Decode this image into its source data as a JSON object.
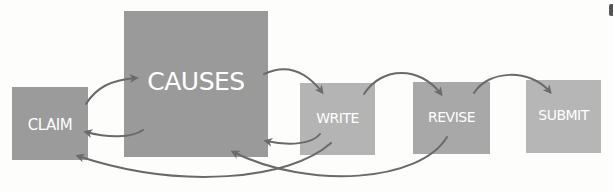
{
  "diagram": {
    "nodes": [
      {
        "id": "claim",
        "label": "CLAIM",
        "x": 12,
        "y": 87,
        "w": 76,
        "h": 73,
        "color": "#9b9b9b",
        "font_size": 15,
        "label_top": 31
      },
      {
        "id": "causes",
        "label": "CAUSES",
        "x": 124,
        "y": 11,
        "w": 144,
        "h": 146,
        "color": "#9a9a9a",
        "font_size": 25,
        "label_top": 60
      },
      {
        "id": "write",
        "label": "WRITE",
        "x": 300,
        "y": 83,
        "w": 75,
        "h": 72,
        "color": "#b4b4b4",
        "font_size": 14,
        "label_top": 27
      },
      {
        "id": "revise",
        "label": "REVISE",
        "x": 413,
        "y": 82,
        "w": 77,
        "h": 72,
        "color": "#a8a8a8",
        "font_size": 14,
        "label_top": 28
      },
      {
        "id": "submit",
        "label": "SUBMIT",
        "x": 526,
        "y": 80,
        "w": 75,
        "h": 73,
        "color": "#b6b6b6",
        "font_size": 14,
        "label_top": 27
      }
    ],
    "edges": [
      {
        "from": "claim",
        "to": "causes",
        "direction": "forward"
      },
      {
        "from": "causes",
        "to": "claim",
        "direction": "back"
      },
      {
        "from": "causes",
        "to": "write",
        "direction": "forward"
      },
      {
        "from": "write",
        "to": "causes",
        "direction": "back"
      },
      {
        "from": "write",
        "to": "claim",
        "direction": "back"
      },
      {
        "from": "write",
        "to": "revise",
        "direction": "forward"
      },
      {
        "from": "revise",
        "to": "causes",
        "direction": "back"
      },
      {
        "from": "revise",
        "to": "submit",
        "direction": "forward"
      }
    ],
    "arrow_color": "#6a6a6a"
  }
}
